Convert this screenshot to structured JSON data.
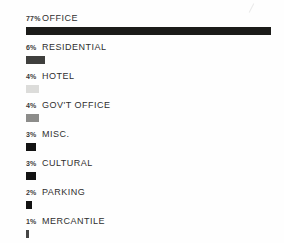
{
  "page": {
    "background": "#fefefe",
    "text_color": "#2f2f2f"
  },
  "chart_data": {
    "type": "bar",
    "orientation": "horizontal",
    "unit": "%",
    "title": "",
    "xlabel": "",
    "ylabel": "",
    "legend": "none",
    "grid": false,
    "axes": "none",
    "categories": [
      "OFFICE",
      "RESIDENTIAL",
      "HOTEL",
      "GOV'T OFFICE",
      "MISC.",
      "CULTURAL",
      "PARKING",
      "MERCANTILE"
    ],
    "values": [
      77,
      6,
      4,
      4,
      3,
      3,
      2,
      1
    ],
    "percent_labels": [
      "77%",
      "6%",
      "4%",
      "4%",
      "3%",
      "3%",
      "2%",
      "1%"
    ],
    "colors": [
      "#1b1b19",
      "#3f3f3d",
      "#dcdcda",
      "#8c8c8a",
      "#121212",
      "#121212",
      "#121212",
      "#454545"
    ],
    "max_value": 77,
    "max_bar_px": 245,
    "bar_height_px": 8
  }
}
